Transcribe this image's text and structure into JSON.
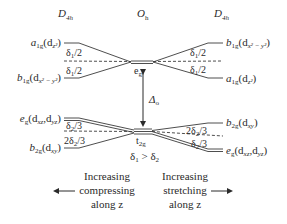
{
  "header": {
    "left_group": "D",
    "left_group_sub": "4h",
    "center_group": "O",
    "center_group_sub": "h",
    "right_group": "D",
    "right_group_sub": "4h"
  },
  "center": {
    "eg_label": "e",
    "eg_sub": "g",
    "t2g_label": "t",
    "t2g_sub": "2g",
    "delta_o": "Δ",
    "delta_o_sub": "o",
    "condition": "δ",
    "condition_sub1": "1",
    "condition_mid": " > δ",
    "condition_sub2": "2"
  },
  "left_upper": {
    "top_label": "a",
    "top_sub": "1g",
    "top_orbital": "(d",
    "top_orbital_sub": "z²",
    "top_close": ")",
    "bottom_label": "b",
    "bottom_sub": "1g",
    "bottom_orbital": "(d",
    "bottom_orbital_sub": "x² − y²",
    "bottom_close": ")",
    "split_top": "δ",
    "split_top_sub": "1",
    "split_top_tail": "/2",
    "split_bottom": "δ",
    "split_bottom_sub": "1",
    "split_bottom_tail": "/2"
  },
  "right_upper": {
    "top_label": "b",
    "top_sub": "1g",
    "top_orbital": "(d",
    "top_orbital_sub": "x² − y²",
    "top_close": ")",
    "bottom_label": "a",
    "bottom_sub": "1g",
    "bottom_orbital": "(d",
    "bottom_orbital_sub": "z²",
    "bottom_close": ")",
    "split_top": "δ",
    "split_top_sub": "1",
    "split_top_tail": "/2",
    "split_bottom": "δ",
    "split_bottom_sub": "1",
    "split_bottom_tail": "/2"
  },
  "left_lower": {
    "top_label": "e",
    "top_sub": "g",
    "top_orbital": "(d",
    "top_orbital_sub1": "xz",
    "top_orbital_mid": ",d",
    "top_orbital_sub2": "yz",
    "top_close": ")",
    "bottom_label": "b",
    "bottom_sub": "2g",
    "bottom_orbital": "(d",
    "bottom_orbital_sub": "xy",
    "bottom_close": ")",
    "split_top": "δ",
    "split_top_sub": "2",
    "split_top_tail": "/3",
    "split_bottom": "2δ",
    "split_bottom_sub": "2",
    "split_bottom_tail": "/3"
  },
  "right_lower": {
    "top_label": "b",
    "top_sub": "2g",
    "top_orbital": "(d",
    "top_orbital_sub": "xy",
    "top_close": ")",
    "bottom_label": "e",
    "bottom_sub": "g",
    "bottom_orbital": "(d",
    "bottom_orbital_sub1": "xz",
    "bottom_orbital_mid": ",d",
    "bottom_orbital_sub2": "yz",
    "bottom_close": ")",
    "split_top": "2δ",
    "split_top_sub": "2",
    "split_top_tail": "/3",
    "split_bottom": "δ",
    "split_bottom_sub": "2",
    "split_bottom_tail": "/3"
  },
  "footer": {
    "left_line1": "Increasing",
    "left_line2": "compressing",
    "left_line3": "along z",
    "right_line1": "Increasing",
    "right_line2": "stretching",
    "right_line3": "along z"
  },
  "colors": {
    "line": "#3a3a3a",
    "text": "#2a2a2a",
    "background": "#ffffff"
  }
}
